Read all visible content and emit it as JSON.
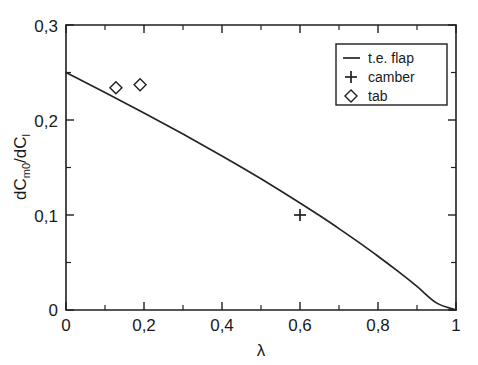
{
  "chart_data": {
    "type": "line",
    "title": "",
    "subtitle": "",
    "xlabel": "λ",
    "ylabel": "dC_m0/dC_l",
    "ylabel_parts": {
      "lead": "dC",
      "sub1": "m0",
      "mid": "/dC",
      "sub2": "l"
    },
    "xlim": [
      0,
      1
    ],
    "ylim": [
      0,
      0.3
    ],
    "grid": false,
    "xticks": [
      0,
      0.2,
      0.4,
      0.6,
      0.8,
      1
    ],
    "xticklabels": [
      "0",
      "0,2",
      "0,4",
      "0,6",
      "0,8",
      "1"
    ],
    "xminorticks": [
      0.1,
      0.3,
      0.5,
      0.7,
      0.9
    ],
    "yticks": [
      0,
      0.1,
      0.2,
      0.3
    ],
    "yticklabels": [
      "0",
      "0,1",
      "0,2",
      "0,3"
    ],
    "yminorticks": [
      0.05,
      0.15,
      0.25
    ],
    "legend_position": "upper right",
    "series": [
      {
        "name": "t.e. flap",
        "marker": "line",
        "type": "line",
        "x": [
          0.0,
          0.05,
          0.1,
          0.15,
          0.2,
          0.25,
          0.3,
          0.35,
          0.4,
          0.45,
          0.5,
          0.55,
          0.6,
          0.65,
          0.7,
          0.75,
          0.8,
          0.85,
          0.9,
          0.95,
          1.0
        ],
        "y": [
          0.25,
          0.2395,
          0.2289,
          0.2182,
          0.2074,
          0.1964,
          0.1852,
          0.1738,
          0.1622,
          0.1503,
          0.1381,
          0.1256,
          0.1127,
          0.0994,
          0.0857,
          0.0714,
          0.0566,
          0.0411,
          0.0248,
          0.0075,
          0.0
        ]
      },
      {
        "name": "camber",
        "marker": "plus",
        "type": "scatter",
        "x": [
          0.6
        ],
        "y": [
          0.1
        ]
      },
      {
        "name": "tab",
        "marker": "diamond",
        "type": "scatter",
        "x": [
          0.128,
          0.19
        ],
        "y": [
          0.234,
          0.237
        ]
      }
    ],
    "legend_entries": [
      {
        "label": "t.e. flap",
        "marker": "line"
      },
      {
        "label": "camber",
        "marker": "plus"
      },
      {
        "label": "tab",
        "marker": "diamond"
      }
    ]
  },
  "colors": {
    "axis": "#1f1f1f",
    "curve": "#242424",
    "marker": "#202020",
    "background": "#ffffff"
  }
}
